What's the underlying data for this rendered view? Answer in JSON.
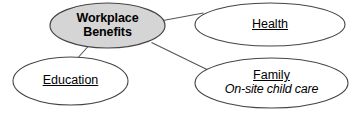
{
  "diagram": {
    "type": "concept-map",
    "title_node": "Workplace Benefits",
    "canvas": {
      "width": 357,
      "height": 114,
      "background": "#ffffff"
    },
    "style": {
      "center_fill": "#d5d5d5",
      "leaf_fill": "#ffffff",
      "stroke": "#444444",
      "text_color": "#000000"
    },
    "nodes": [
      {
        "id": "center",
        "line1": "Workplace",
        "line2": "Benefits",
        "role": "central-topic",
        "fill": "#d5d5d5"
      },
      {
        "id": "health",
        "label": "Health",
        "role": "branch",
        "fill": "#ffffff"
      },
      {
        "id": "education",
        "label": "Education",
        "role": "branch",
        "fill": "#ffffff"
      },
      {
        "id": "family",
        "label": "Family",
        "detail": "On-site child care",
        "role": "branch",
        "fill": "#ffffff"
      }
    ],
    "connectors": [
      {
        "from": "center",
        "to": "health"
      },
      {
        "from": "center",
        "to": "education"
      },
      {
        "from": "center",
        "to": "family"
      }
    ]
  }
}
